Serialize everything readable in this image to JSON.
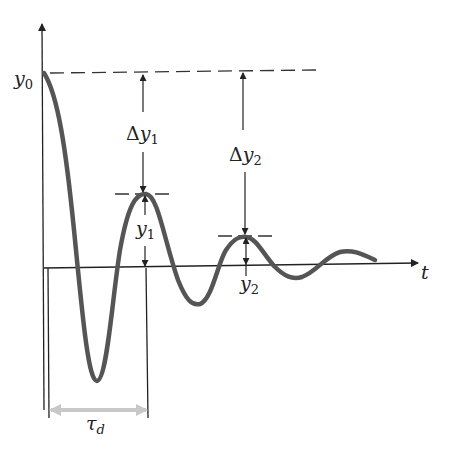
{
  "diagram": {
    "labels": {
      "y0_main": "y",
      "y0_sub": "0",
      "t_axis": "t",
      "dy1_delta": "Δ",
      "dy1_main": "y",
      "dy1_sub": "1",
      "dy2_delta": "Δ",
      "dy2_main": "y",
      "dy2_sub": "2",
      "y1_main": "y",
      "y1_sub": "1",
      "y2_main": "y",
      "y2_sub": "2",
      "tau_main": "τ",
      "tau_sub": "d"
    },
    "colors": {
      "curve": "#555555",
      "axes": "#222222",
      "dashed": "#333333",
      "tau_arrow": "#c8c8c8"
    }
  }
}
